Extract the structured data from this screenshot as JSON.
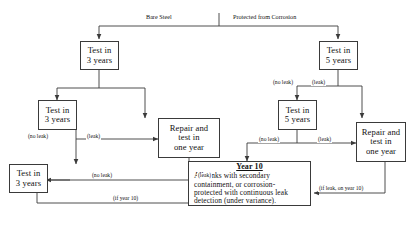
{
  "diagram": {
    "type": "flowchart",
    "stroke_color": "#3a3a3a",
    "background": "#ffffff",
    "branches": [
      {
        "id": "bare-steel",
        "label": "Bare Steel"
      },
      {
        "id": "protected-from-corrosion",
        "label": "Protected from Corrosion"
      }
    ],
    "nodes": [
      {
        "id": "bare-test-3a",
        "lines": [
          "Test in",
          "3 years"
        ]
      },
      {
        "id": "bare-test-3b",
        "lines": [
          "Test in",
          "3 years"
        ]
      },
      {
        "id": "bare-repair",
        "lines": [
          "Repair and",
          "test in",
          "one year"
        ]
      },
      {
        "id": "bare-test-3c",
        "lines": [
          "Test in",
          "3 years"
        ]
      },
      {
        "id": "prot-test-5a",
        "lines": [
          "Test in",
          "5 years"
        ]
      },
      {
        "id": "prot-test-5b",
        "lines": [
          "Test in",
          "5 years"
        ]
      },
      {
        "id": "prot-repair",
        "lines": [
          "Repair and",
          "test in",
          "one year"
        ]
      }
    ],
    "year10": {
      "heading": "Year 10",
      "lines": [
        "All tanks with secondary",
        "containment, or corrosion-",
        "protected with continuous leak",
        "detection (under variance)."
      ]
    },
    "edge_labels": {
      "bare_noleak_1": "(no leak)",
      "bare_leak_1": "(leak)",
      "bare_noleak_2": "(no leak)",
      "bare_leak_2": "(leak)",
      "bare_if_year10": "(if year 10)",
      "prot_noleak_1": "(no leak)",
      "prot_leak_1": "(leak)",
      "prot_noleak_2": "(no leak)",
      "prot_leak_2": "(leak)",
      "prot_if_leak_year10": "(if leak, on year 10)"
    }
  }
}
